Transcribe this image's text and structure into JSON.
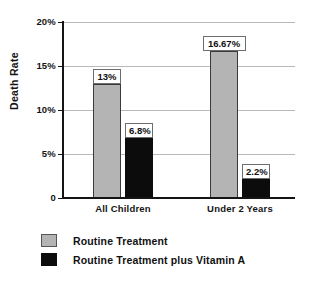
{
  "chart_data": {
    "type": "bar",
    "title": "",
    "xlabel": "",
    "ylabel": "Death Rate",
    "categories": [
      "All Children",
      "Under 2 Years"
    ],
    "series": [
      {
        "name": "Routine Treatment",
        "color": "#b4b4b4",
        "values": [
          13,
          16.67
        ],
        "value_labels": [
          "13%",
          "16.67%"
        ]
      },
      {
        "name": "Routine Treatment plus Vitamin A",
        "color": "#0c0c0c",
        "values": [
          6.8,
          2.2
        ],
        "value_labels": [
          "6.8%",
          "2.2%"
        ]
      }
    ],
    "ylim": [
      0,
      20
    ],
    "yticks": [
      0,
      5,
      10,
      15,
      20
    ],
    "ytick_labels": [
      "0",
      "5%",
      "10%",
      "15%",
      "20%"
    ],
    "grid": true,
    "legend_position": "bottom-left"
  },
  "axis": {
    "y_title": "Death Rate",
    "ticks": [
      {
        "label": "20%",
        "value": 20
      },
      {
        "label": "15%",
        "value": 15
      },
      {
        "label": "10%",
        "value": 10
      },
      {
        "label": "5%",
        "value": 5
      },
      {
        "label": "0",
        "value": 0
      }
    ]
  },
  "categories": [
    {
      "label": "All Children"
    },
    {
      "label": "Under 2 Years"
    }
  ],
  "bars": [
    {
      "label": "13%",
      "value": 13,
      "series": 0,
      "group": 0
    },
    {
      "label": "6.8%",
      "value": 6.8,
      "series": 1,
      "group": 0
    },
    {
      "label": "16.67%",
      "value": 16.67,
      "series": 0,
      "group": 1
    },
    {
      "label": "2.2%",
      "value": 2.2,
      "series": 1,
      "group": 1
    }
  ],
  "legend": {
    "items": [
      {
        "label": "Routine Treatment",
        "color": "#b4b4b4"
      },
      {
        "label": "Routine Treatment plus Vitamin A",
        "color": "#0c0c0c"
      }
    ]
  }
}
